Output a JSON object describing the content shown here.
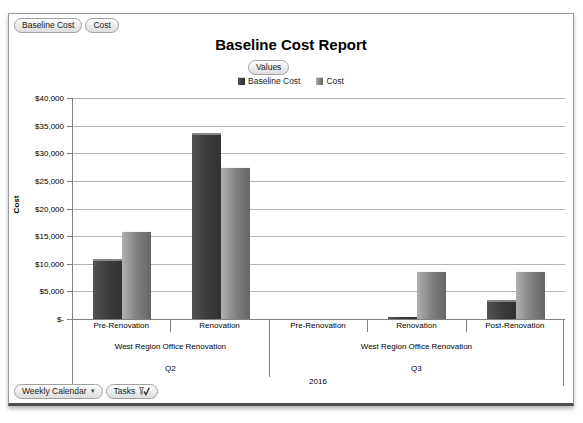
{
  "report": {
    "field_chips": [
      {
        "label": "Baseline Cost"
      },
      {
        "label": "Cost"
      }
    ],
    "values_chip": "Values",
    "footer_chips": [
      {
        "label": "Weekly Calendar",
        "icon": "dropdown-arrow"
      },
      {
        "label": "Tasks",
        "icon": "filter-check"
      }
    ]
  },
  "chart_data": {
    "type": "bar",
    "title": "Baseline Cost Report",
    "ylabel": "Cost",
    "ylim": [
      0,
      40000
    ],
    "ytick_step": 5000,
    "ytick_labels": [
      "$-",
      "$5,000",
      "$10,000",
      "$15,000",
      "$20,000",
      "$25,000",
      "$30,000",
      "$35,000",
      "$40,000"
    ],
    "grid": true,
    "legend_position": "top",
    "x_hierarchy": {
      "year": "2016",
      "groups": [
        {
          "quarter": "Q2",
          "project": "West Region Office Renovation",
          "tasks": [
            "Pre-Renovation",
            "Renovation"
          ]
        },
        {
          "quarter": "Q3",
          "project": "West Region Office Renovation",
          "tasks": [
            "Pre-Renovation",
            "Renovation",
            "Post-Renovation"
          ]
        }
      ]
    },
    "categories": [
      "Pre-Renovation (Q2)",
      "Renovation (Q2)",
      "Pre-Renovation (Q3)",
      "Renovation (Q3)",
      "Post-Renovation (Q3)"
    ],
    "series": [
      {
        "name": "Baseline Cost",
        "color": "#3d3d3d",
        "values": [
          10800,
          33700,
          0,
          300,
          3400
        ]
      },
      {
        "name": "Cost",
        "color": "#828282",
        "values": [
          16100,
          27700,
          0,
          8900,
          8900
        ]
      }
    ]
  }
}
